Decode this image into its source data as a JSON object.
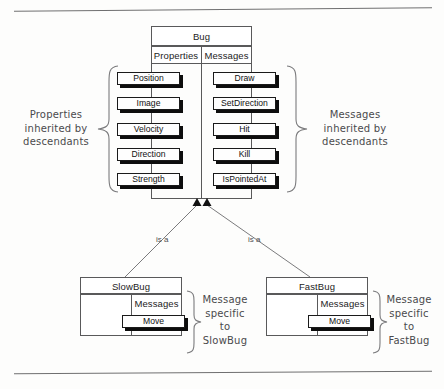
{
  "figure": {
    "kind": "class-inheritance-diagram"
  },
  "base_class": {
    "name": "Bug",
    "columns": [
      {
        "header": "Properties"
      },
      {
        "header": "Messages"
      }
    ],
    "properties": [
      "Position",
      "Image",
      "Velocity",
      "Direction",
      "Strength"
    ],
    "messages": [
      "Draw",
      "SetDirection",
      "Hit",
      "Kill",
      "IsPointedAt"
    ]
  },
  "annotations": {
    "left": "Properties\ninherited by\ndescendants",
    "right": "Messages\ninherited by\ndescendants",
    "slowbug": "Message\nspecific\nto\nSlowBug",
    "fastbug": "Message\nspecific\nto\nFastBug"
  },
  "relations": {
    "left_label": "is a",
    "right_label": "is a"
  },
  "subclasses": [
    {
      "name": "SlowBug",
      "section_header": "Messages",
      "messages": [
        "Move"
      ]
    },
    {
      "name": "FastBug",
      "section_header": "Messages",
      "messages": [
        "Move"
      ]
    }
  ],
  "colors": {
    "line": "#59595a",
    "button_border": "#1a1a1a",
    "button_shadow": "#0d0d0d",
    "note_text": "#4a4a4c",
    "background": "#fdfdfc"
  }
}
